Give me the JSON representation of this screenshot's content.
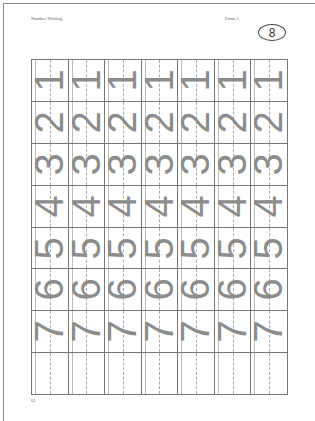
{
  "header": {
    "title": "Number Writing",
    "form": "Form A",
    "badge_number": "8"
  },
  "grid": {
    "columns": 7,
    "rows": [
      {
        "digit": "1"
      },
      {
        "digit": "2"
      },
      {
        "digit": "3"
      },
      {
        "digit": "4"
      },
      {
        "digit": "5"
      },
      {
        "digit": "6"
      },
      {
        "digit": "7"
      },
      {
        "digit": ""
      }
    ],
    "digit_color": "#8c8c8c",
    "line_color": "#777777"
  },
  "footer": {
    "page_number": "62"
  }
}
